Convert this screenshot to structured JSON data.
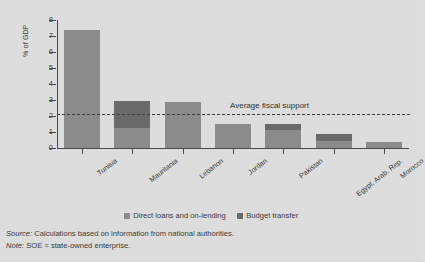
{
  "chart_data": {
    "type": "bar",
    "title": "",
    "subtitle": "",
    "xlabel": "",
    "ylabel": "% of GDP",
    "ylim": [
      0,
      8
    ],
    "yticks": [
      0,
      1,
      2,
      3,
      4,
      5,
      6,
      7,
      8
    ],
    "ytick_labels": [
      "0",
      "1",
      "2",
      "3",
      "4",
      "5",
      "6",
      "7",
      "8"
    ],
    "grid": false,
    "stacked": true,
    "legend_position": "bottom",
    "categories": [
      "Tunisia",
      "Mauritania",
      "Lebanon",
      "Jordan",
      "Pakistan",
      "Egypt, Arab. Rep.",
      "Morocco"
    ],
    "series": [
      {
        "name": "Direct loans and on-lending",
        "color": "#8b8b8b",
        "values": [
          7.4,
          1.25,
          2.88,
          1.5,
          1.15,
          0.45,
          0.35
        ]
      },
      {
        "name": "Budget transfer",
        "color": "#6a6a6a",
        "values": [
          0,
          1.7,
          0,
          0,
          0.35,
          0.4,
          0
        ]
      }
    ],
    "totals": [
      7.4,
      2.95,
      2.88,
      1.5,
      1.5,
      0.85,
      0.35
    ],
    "annotations": [
      {
        "name": "average-fiscal-support",
        "label": "Average fiscal support",
        "type": "hline",
        "value": 2.1,
        "style": "dashed",
        "color": "#3d3d3d"
      }
    ]
  },
  "footnotes": [
    {
      "lead": "Source:",
      "text": " Calculations based on information from national authorities."
    },
    {
      "lead": "Note:",
      "text": " SOE = state-owned enterprise."
    }
  ],
  "colors": {
    "background": "#dedede",
    "axis": "#4a4a4a",
    "text": "#3a3a3a",
    "direct_loans": "#8b8b8b",
    "budget_transfer": "#6a6a6a",
    "average_line": "#3d3d3d"
  }
}
